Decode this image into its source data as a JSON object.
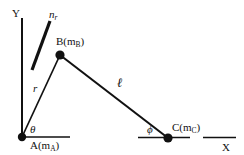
{
  "figure": {
    "type": "mechanical-linkage-diagram",
    "background_color": "#ffffff",
    "line_color": "#111111",
    "width": 244,
    "height": 155
  },
  "axes": {
    "y_label": "Y",
    "x_label": "X",
    "origin_label": "A"
  },
  "points": [
    {
      "id": "A",
      "label_main": "A(m",
      "label_sub": "A",
      "label_close": ")",
      "x": 22,
      "y": 137,
      "mass_symbol": "m_A"
    },
    {
      "id": "B",
      "label_main": "B(m",
      "label_sub": "B",
      "label_close": ")",
      "x": 60,
      "y": 55,
      "mass_symbol": "m_B"
    },
    {
      "id": "C",
      "label_main": "C(m",
      "label_sub": "C",
      "label_close": ")",
      "x": 168,
      "y": 138,
      "mass_symbol": "m_C"
    }
  ],
  "segments": {
    "r_label": "r",
    "ell_label": "ℓ"
  },
  "angles": {
    "theta_label": "θ",
    "phi_label": "ϕ"
  },
  "vectors": {
    "n_r_main": "n",
    "n_r_sub": "r"
  }
}
